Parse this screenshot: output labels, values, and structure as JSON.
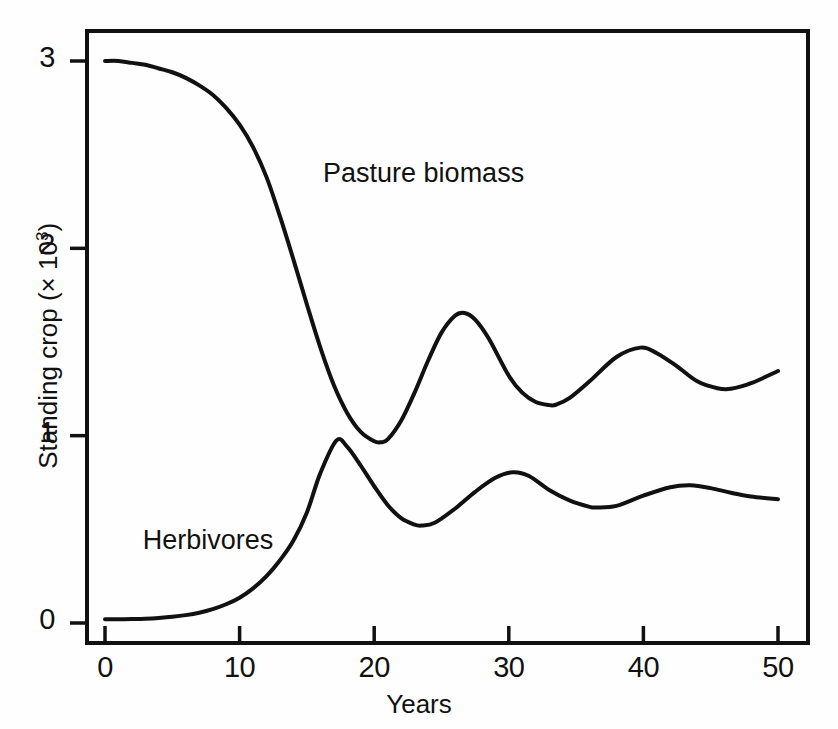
{
  "chart_data": {
    "type": "line",
    "title": "",
    "xlabel": "Years",
    "ylabel": "Standing crop (× 10³)",
    "xlim": [
      0,
      50
    ],
    "ylim": [
      0,
      3.15
    ],
    "xticks": [
      0,
      10,
      20,
      30,
      40,
      50
    ],
    "xtick_labels": [
      "0",
      "10",
      "20",
      "30",
      "40",
      "50"
    ],
    "yticks": [
      0,
      1,
      2,
      3
    ],
    "ytick_labels": [
      "0",
      "1",
      "2",
      "3"
    ],
    "grid": false,
    "legend": "inline-annotations",
    "series": [
      {
        "name": "Pasture biomass",
        "label_position": {
          "x": 16.2,
          "y": 2.39
        },
        "x": [
          0,
          1,
          2,
          3,
          4,
          5,
          6,
          7,
          8,
          9,
          10,
          11,
          12,
          13,
          14,
          15,
          16,
          17,
          18,
          19,
          20,
          20.5,
          21,
          22,
          23,
          24,
          25,
          26,
          26.7,
          27.5,
          28.5,
          30,
          31,
          32,
          33,
          33.5,
          34.5,
          36,
          38,
          39.8,
          41,
          42.5,
          44,
          45.5,
          46.5,
          48,
          50
        ],
        "y": [
          3.0,
          3.0,
          2.99,
          2.98,
          2.96,
          2.94,
          2.91,
          2.87,
          2.82,
          2.75,
          2.66,
          2.54,
          2.38,
          2.17,
          1.94,
          1.7,
          1.47,
          1.27,
          1.12,
          1.02,
          0.97,
          0.965,
          0.98,
          1.08,
          1.23,
          1.4,
          1.55,
          1.64,
          1.655,
          1.62,
          1.52,
          1.32,
          1.23,
          1.18,
          1.163,
          1.165,
          1.2,
          1.29,
          1.42,
          1.47,
          1.44,
          1.37,
          1.29,
          1.253,
          1.25,
          1.28,
          1.345
        ]
      },
      {
        "name": "Herbivores",
        "label_position": {
          "x": 2.8,
          "y": 0.43
        },
        "x": [
          0,
          1,
          2,
          3,
          4,
          5,
          6,
          7,
          8,
          9,
          10,
          11,
          12,
          13,
          14,
          15,
          16,
          17.2,
          18,
          19,
          20,
          21,
          22,
          23,
          23.5,
          24.5,
          26,
          27.5,
          29,
          30.3,
          31.5,
          33,
          34.5,
          36,
          36.5,
          38,
          40,
          42,
          43.5,
          45,
          46.5,
          48,
          50
        ],
        "y": [
          0.02,
          0.02,
          0.021,
          0.023,
          0.027,
          0.033,
          0.042,
          0.055,
          0.074,
          0.1,
          0.135,
          0.185,
          0.25,
          0.335,
          0.44,
          0.59,
          0.8,
          0.975,
          0.94,
          0.84,
          0.73,
          0.63,
          0.56,
          0.525,
          0.52,
          0.535,
          0.61,
          0.7,
          0.775,
          0.805,
          0.785,
          0.71,
          0.655,
          0.62,
          0.617,
          0.625,
          0.68,
          0.725,
          0.735,
          0.72,
          0.695,
          0.675,
          0.66
        ]
      }
    ]
  },
  "figure": {
    "axis_color": "#111111",
    "line_color": "#111111",
    "background": "#ffffff",
    "frame": {
      "left": 87,
      "right": 808,
      "top": 31,
      "bottom": 643
    }
  }
}
